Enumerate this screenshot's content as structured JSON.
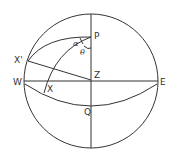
{
  "diagram": {
    "type": "celestial-sphere",
    "labels": {
      "pole": "P",
      "zenith": "Z",
      "west": "W",
      "east": "E",
      "q_point": "Q",
      "x_prime": "X'",
      "x": "X",
      "alpha": "α",
      "theta": "θ"
    },
    "colors": {
      "stroke": "#333333",
      "background": "#ffffff"
    }
  }
}
